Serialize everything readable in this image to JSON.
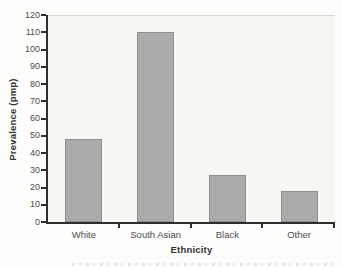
{
  "chart_data": {
    "type": "bar",
    "title": "",
    "categories": [
      "White",
      "South Asian",
      "Black",
      "Other"
    ],
    "values": [
      48,
      110,
      27,
      18
    ],
    "xlabel": "Ethnicity",
    "ylabel": "Prevalence (pmp)",
    "ylim": [
      0,
      120
    ],
    "yticks": [
      0,
      10,
      20,
      30,
      40,
      50,
      60,
      70,
      80,
      90,
      100,
      110,
      120
    ],
    "grid": false,
    "legend": "none",
    "colors": {
      "bar": "#ababab",
      "bar_border": "#8f8f8f",
      "axis": "#2e2e2e",
      "tick_label": "#4d4d4d",
      "axis_title": "#333330",
      "plot_background": "#f8f7f4"
    }
  }
}
